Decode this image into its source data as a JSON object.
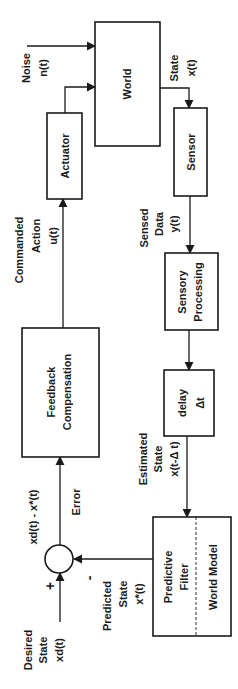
{
  "diagram": {
    "blocks": {
      "world": "World",
      "actuator": "Actuator",
      "sensor": "Sensor",
      "sensory_processing": [
        "Sensory",
        "Processing"
      ],
      "delay": [
        "delay",
        "Δt"
      ],
      "predictive_filter": [
        "Predictive",
        "Filter"
      ],
      "world_model": "World Model",
      "feedback_compensation": [
        "Feedback",
        "Compensation"
      ]
    },
    "signals": {
      "noise": [
        "Noise",
        "n(t)"
      ],
      "state": [
        "State",
        "x(t)"
      ],
      "commanded_action": [
        "Commanded",
        "Action",
        "u(t)"
      ],
      "sensed_data": [
        "Sensed",
        "Data",
        "y(t)"
      ],
      "estimated_state": [
        "Estimated",
        "State",
        "x(t-Δ t)"
      ],
      "predicted_state": [
        "Predicted",
        "State",
        "x*(t)"
      ],
      "desired_state": [
        "Desired",
        "State",
        "xd(t)"
      ],
      "error": "Error",
      "error_expr": "xd(t) - x*(t)"
    },
    "summing_junction": {
      "plus": "+",
      "minus": "-"
    }
  }
}
